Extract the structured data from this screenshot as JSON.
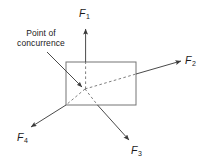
{
  "figure": {
    "type": "free-body force diagram",
    "title": "",
    "background_color": "#ffffff",
    "stroke_color": "#555555",
    "text_color": "#1a1a1a",
    "body": {
      "shape": "rectangle",
      "x": 66,
      "y": 62,
      "width": 70,
      "height": 43
    },
    "concurrence_point": {
      "x": 85,
      "y": 89
    },
    "callout": {
      "line1": "Point of",
      "line2": "concurrence",
      "leader_from": {
        "x": 47,
        "y": 52
      },
      "leader_to": {
        "x": 84,
        "y": 88
      }
    },
    "forces": [
      {
        "name": "F1",
        "label": "F",
        "subscript": "1",
        "direction": "up",
        "tip": {
          "x": 85,
          "y": 27
        },
        "tail": {
          "x": 86,
          "y": 89
        },
        "solid_from": {
          "x": 85.6,
          "y": 62
        },
        "dashed_inside": true
      },
      {
        "name": "F2",
        "label": "F",
        "subscript": "2",
        "direction": "up-right",
        "tip": {
          "x": 183,
          "y": 60
        },
        "tail": {
          "x": 85,
          "y": 89
        },
        "solid_from": {
          "x": 136,
          "y": 74
        },
        "dashed_inside": true
      },
      {
        "name": "F3",
        "label": "F",
        "subscript": "3",
        "direction": "down-right",
        "tip": {
          "x": 131,
          "y": 141
        },
        "tail": {
          "x": 85,
          "y": 89
        },
        "solid_from": {
          "x": 97,
          "y": 105
        },
        "dashed_inside": true
      },
      {
        "name": "F4",
        "label": "F",
        "subscript": "4",
        "direction": "down-left",
        "tip": {
          "x": 29,
          "y": 128
        },
        "tail": {
          "x": 85,
          "y": 89
        },
        "solid_from": {
          "x": 66,
          "y": 105
        },
        "dashed_inside": true
      }
    ]
  }
}
